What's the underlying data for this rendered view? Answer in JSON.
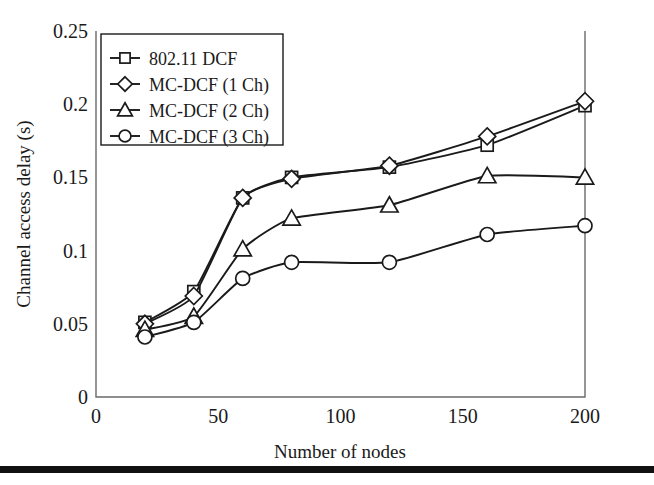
{
  "chart_data": {
    "type": "line",
    "title": "",
    "xlabel": "Number of nodes",
    "ylabel": "Channel access delay (s)",
    "xlim": [
      0,
      200
    ],
    "ylim": [
      0,
      0.25
    ],
    "grid": false,
    "legend_position": "top-left",
    "x_ticks": [
      "0",
      "50",
      "100",
      "150",
      "200"
    ],
    "x_tick_values": [
      0,
      50,
      100,
      150,
      200
    ],
    "y_ticks": [
      "0",
      "0.05",
      "0.1",
      "0.15",
      "0.2",
      "0.25"
    ],
    "y_tick_values": [
      0,
      0.05,
      0.1,
      0.15,
      0.2,
      0.25
    ],
    "x": [
      20,
      40,
      60,
      80,
      120,
      160,
      200
    ],
    "series": [
      {
        "name": "802.11 DCF",
        "marker": "square",
        "values": [
          0.051,
          0.072,
          0.136,
          0.15,
          0.157,
          0.172,
          0.199
        ]
      },
      {
        "name": "MC-DCF (1 Ch)",
        "marker": "diamond",
        "values": [
          0.05,
          0.069,
          0.136,
          0.149,
          0.158,
          0.178,
          0.202
        ]
      },
      {
        "name": "MC-DCF (2 Ch)",
        "marker": "triangle",
        "values": [
          0.046,
          0.055,
          0.101,
          0.122,
          0.131,
          0.151,
          0.15
        ]
      },
      {
        "name": "MC-DCF (3 Ch)",
        "marker": "circle",
        "values": [
          0.041,
          0.051,
          0.081,
          0.092,
          0.092,
          0.111,
          0.117
        ]
      }
    ]
  },
  "legend": {
    "entries": [
      {
        "label": "802.11 DCF",
        "marker": "square"
      },
      {
        "label": "MC-DCF (1 Ch)",
        "marker": "diamond"
      },
      {
        "label": "MC-DCF (2 Ch)",
        "marker": "triangle"
      },
      {
        "label": "MC-DCF (3 Ch)",
        "marker": "circle"
      }
    ]
  },
  "colors": {
    "line": "#1a1a1a",
    "axis": "#6a6a6a",
    "marker_fill": "#ffffff",
    "background": "#ffffff",
    "rule": "#111111"
  }
}
